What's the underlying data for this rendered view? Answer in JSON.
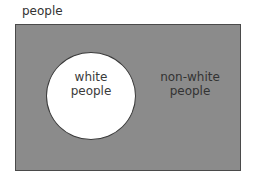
{
  "diagram": {
    "type": "venn",
    "universe": {
      "label": "people",
      "color": "#8b8b8b"
    },
    "subset": {
      "label_line1": "white",
      "label_line2": "people",
      "color": "#ffffff"
    },
    "complement": {
      "label_line1": "non-white",
      "label_line2": "people"
    }
  }
}
